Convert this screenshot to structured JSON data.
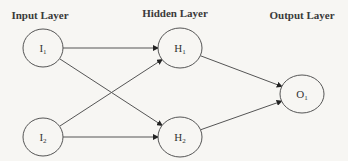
{
  "diagram": {
    "type": "neural-network",
    "layers": [
      {
        "id": "input",
        "label": "Input Layer",
        "x": 40,
        "y": 19
      },
      {
        "id": "hidden",
        "label": "Hidden Layer",
        "x": 175,
        "y": 17
      },
      {
        "id": "output",
        "label": "Output Layer",
        "x": 302,
        "y": 19
      }
    ],
    "nodes": [
      {
        "id": "I1",
        "main": "I",
        "sub": "1",
        "layer": "input",
        "cx": 43,
        "cy": 48,
        "rx": 20,
        "ry": 19
      },
      {
        "id": "I2",
        "main": "I",
        "sub": "2",
        "layer": "input",
        "cx": 43,
        "cy": 137,
        "rx": 20,
        "ry": 19
      },
      {
        "id": "H1",
        "main": "H",
        "sub": "1",
        "layer": "hidden",
        "cx": 180,
        "cy": 48,
        "rx": 22,
        "ry": 20
      },
      {
        "id": "H2",
        "main": "H",
        "sub": "2",
        "layer": "hidden",
        "cx": 180,
        "cy": 137,
        "rx": 22,
        "ry": 20
      },
      {
        "id": "O1",
        "main": "O",
        "sub": "1",
        "layer": "output",
        "cx": 302,
        "cy": 94,
        "rx": 22,
        "ry": 19
      }
    ],
    "edges": [
      {
        "from": "I1",
        "to": "H1"
      },
      {
        "from": "I1",
        "to": "H2"
      },
      {
        "from": "I2",
        "to": "H1"
      },
      {
        "from": "I2",
        "to": "H2"
      },
      {
        "from": "H1",
        "to": "O1"
      },
      {
        "from": "H2",
        "to": "O1"
      }
    ],
    "colors": {
      "stroke": "#555555",
      "text": "#333333",
      "background": "#f7f6f3"
    }
  }
}
